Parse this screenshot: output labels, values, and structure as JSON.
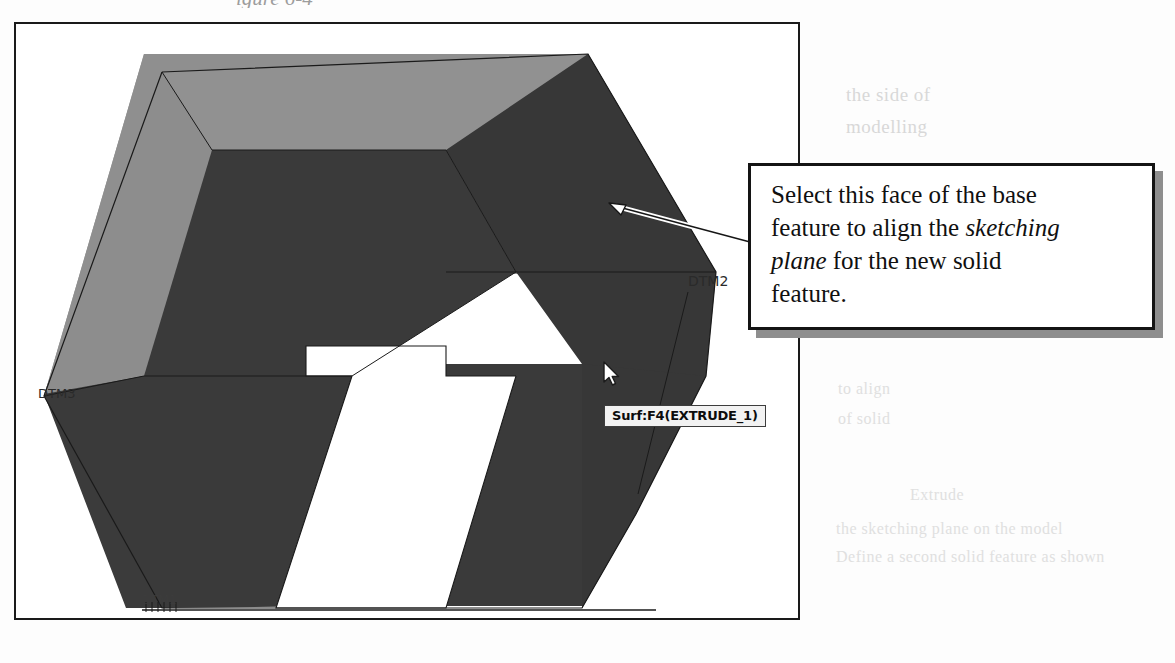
{
  "page": {
    "caption_fragment": "igure 6-4",
    "bleed_text": [
      "the side of",
      "modelling",
      "to align",
      "of solid",
      "the base",
      "Extrude",
      "Mid Plane",
      "the sketching plane on the model",
      "Define a second solid feature as shown"
    ]
  },
  "app_window": {
    "name": "cad-graphics-window"
  },
  "model": {
    "name": "extruded-u-block",
    "colors": {
      "face_top_light": "#8f8f8f",
      "face_left_mid": "#7f7f7f",
      "face_front_dark": "#3a3a3a",
      "face_side_dark": "#363636",
      "face_inner_dark": "#2f2f2f",
      "edge": "#151515",
      "background": "#ffffff"
    },
    "datum_labels": [
      {
        "id": "dtm3",
        "text": "DTM3",
        "x": 36,
        "y": 368
      },
      {
        "id": "dtm2",
        "text": "DTM2",
        "x": 684,
        "y": 254
      },
      {
        "id": "dtm1",
        "text": "DTM1",
        "x": 140,
        "y": 586
      }
    ]
  },
  "tooltip": {
    "text": "Surf:F4(EXTRUDE_1)"
  },
  "cursor": {
    "type": "arrow-pointer",
    "x": 586,
    "y": 337
  },
  "callout": {
    "line1": "Select this face of the base",
    "line2_a": "feature to align the ",
    "line2_em": "sketching",
    "line3_em": "plane",
    "line3_b": " for the new solid",
    "line4": "feature."
  }
}
